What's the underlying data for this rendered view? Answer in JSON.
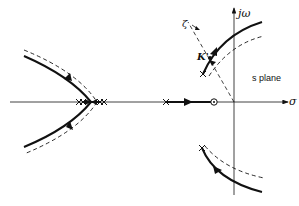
{
  "diagram": {
    "type": "root-locus",
    "labels": {
      "imag_axis": "jω",
      "real_axis": "σ",
      "plane": "s plane",
      "gain_point": "K'",
      "damping_line": "ζ"
    },
    "colors": {
      "ink": "#111111",
      "background": "#ffffff"
    },
    "elements": {
      "poles_left_cluster": 4,
      "poles_real_axis_right": 1,
      "zeros_real_axis": 1,
      "complex_poles": 2
    }
  }
}
